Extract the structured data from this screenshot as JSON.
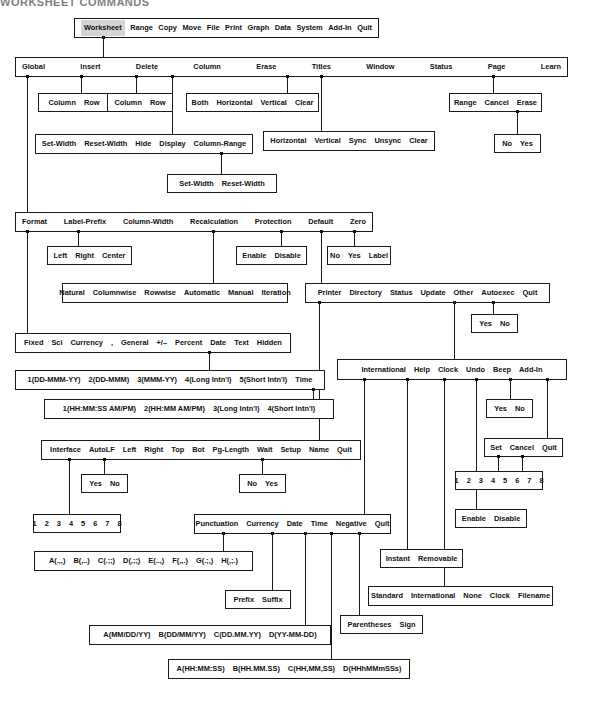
{
  "document": {
    "header_text": "WORKSHEET COMMANDS",
    "diagram_type": "menu-tree",
    "title": "Lotus 1-2-3 Worksheet command menu map"
  },
  "colors": {
    "line": "#1a1a1a",
    "text": "#111111",
    "highlight": "#d4d4d4",
    "background": "#ffffff"
  },
  "boxes": {
    "main_menu": {
      "name": "main-menu",
      "items": [
        "Worksheet",
        "Range",
        "Copy",
        "Move",
        "File",
        "Print",
        "Graph",
        "Data",
        "System",
        "Add-In",
        "Quit"
      ],
      "selected": "Worksheet"
    },
    "worksheet_menu": {
      "name": "worksheet-menu",
      "items": [
        "Global",
        "Insert",
        "Delete",
        "Column",
        "Erase",
        "Titles",
        "Window",
        "Status",
        "Page",
        "Learn"
      ]
    },
    "insert_menu": {
      "name": "insert-menu",
      "items": [
        "Column",
        "Row"
      ]
    },
    "delete_menu": {
      "name": "delete-menu",
      "items": [
        "Column",
        "Row"
      ]
    },
    "titles_menu": {
      "name": "titles-menu",
      "items": [
        "Both",
        "Horizontal",
        "Vertical",
        "Clear"
      ]
    },
    "learn_menu": {
      "name": "learn-menu",
      "items": [
        "Range",
        "Cancel",
        "Erase"
      ]
    },
    "learn_erase_menu": {
      "name": "learn-erase-menu",
      "items": [
        "No",
        "Yes"
      ]
    },
    "column_menu": {
      "name": "column-menu",
      "items": [
        "Set-Width",
        "Reset-Width",
        "Hide",
        "Display",
        "Column-Range"
      ]
    },
    "window_menu": {
      "name": "window-menu",
      "items": [
        "Horizontal",
        "Vertical",
        "Sync",
        "Unsync",
        "Clear"
      ]
    },
    "column_range_menu": {
      "name": "column-range-menu",
      "items": [
        "Set-Width",
        "Reset-Width"
      ]
    },
    "global_menu": {
      "name": "global-menu",
      "items": [
        "Format",
        "Label-Prefix",
        "Column-Width",
        "Recalculation",
        "Protection",
        "Default",
        "Zero"
      ]
    },
    "label_prefix_menu": {
      "name": "label-prefix-menu",
      "items": [
        "Left",
        "Right",
        "Center"
      ]
    },
    "protection_menu": {
      "name": "protection-menu",
      "items": [
        "Enable",
        "Disable"
      ]
    },
    "zero_menu": {
      "name": "zero-menu",
      "items": [
        "No",
        "Yes",
        "Label"
      ]
    },
    "recalculation_menu": {
      "name": "recalculation-menu",
      "items": [
        "Natural",
        "Columnwise",
        "Rowwise",
        "Automatic",
        "Manual",
        "Iteration"
      ]
    },
    "default_menu": {
      "name": "default-menu",
      "items": [
        "Printer",
        "Directory",
        "Status",
        "Update",
        "Other",
        "Autoexec",
        "Quit"
      ]
    },
    "autoexec_menu": {
      "name": "autoexec-menu",
      "items": [
        "Yes",
        "No"
      ]
    },
    "format_menu": {
      "name": "format-menu",
      "items": [
        "Fixed",
        "Sci",
        "Currency",
        ",",
        "General",
        "+/–",
        "Percent",
        "Date",
        "Text",
        "Hidden"
      ]
    },
    "other_menu": {
      "name": "other-menu",
      "items": [
        "International",
        "Help",
        "Clock",
        "Undo",
        "Beep",
        "Add-In"
      ]
    },
    "date_menu": {
      "name": "date-format-menu",
      "items": [
        "1(DD-MMM-YY)",
        "2(DD-MMM)",
        "3(MMM-YY)",
        "4(Long Intn'l)",
        "5(Short Intn'l)",
        "Time"
      ]
    },
    "help_menu": {
      "name": "help-menu",
      "items": [
        "Yes",
        "No"
      ]
    },
    "beep_menu": {
      "name": "beep-menu",
      "items": [
        "Yes",
        "No"
      ]
    },
    "time_menu": {
      "name": "time-format-menu",
      "items": [
        "1(HH:MM:SS AM/PM)",
        "2(HH:MM AM/PM)",
        "3(Long Intn'l)",
        "4(Short Intn'l)"
      ]
    },
    "addin_menu": {
      "name": "add-in-menu",
      "items": [
        "Set",
        "Cancel",
        "Quit"
      ]
    },
    "printer_menu": {
      "name": "printer-menu",
      "items": [
        "Interface",
        "AutoLF",
        "Left",
        "Right",
        "Top",
        "Bot",
        "Pg-Length",
        "Wait",
        "Setup",
        "Name",
        "Quit"
      ]
    },
    "autolf_menu": {
      "name": "autolf-menu",
      "items": [
        "Yes",
        "No"
      ]
    },
    "wait_menu": {
      "name": "wait-menu",
      "items": [
        "No",
        "Yes"
      ]
    },
    "addin_numbers_menu": {
      "name": "add-in-slot-menu",
      "items": [
        "1",
        "2",
        "3",
        "4",
        "5",
        "6",
        "7",
        "8"
      ]
    },
    "undo_menu": {
      "name": "undo-menu",
      "items": [
        "Enable",
        "Disable"
      ]
    },
    "interface_menu": {
      "name": "interface-menu",
      "items": [
        "1",
        "2",
        "3",
        "4",
        "5",
        "6",
        "7",
        "8"
      ]
    },
    "international_menu": {
      "name": "international-menu",
      "items": [
        "Punctuation",
        "Currency",
        "Date",
        "Time",
        "Negative",
        "Quit"
      ]
    },
    "help_type_menu": {
      "name": "help-type-menu",
      "items": [
        "Instant",
        "Removable"
      ]
    },
    "punctuation_menu": {
      "name": "punctuation-menu",
      "items": [
        "A(.,,)",
        "B(,..)",
        "C(.;;)",
        "D(,;;)",
        "E(..,)",
        "F(,,.)",
        "G(.;,)",
        "H(,;.)"
      ]
    },
    "currency_menu": {
      "name": "currency-menu",
      "items": [
        "Prefix",
        "Suffix"
      ]
    },
    "clock_menu": {
      "name": "clock-menu",
      "items": [
        "Standard",
        "International",
        "None",
        "Clock",
        "Filename"
      ]
    },
    "negative_menu": {
      "name": "negative-menu",
      "items": [
        "Parentheses",
        "Sign"
      ]
    },
    "intl_date_menu": {
      "name": "international-date-menu",
      "items": [
        "A(MM/DD/YY)",
        "B(DD/MM/YY)",
        "C(DD.MM.YY)",
        "D(YY-MM-DD)"
      ]
    },
    "intl_time_menu": {
      "name": "international-time-menu",
      "items": [
        "A(HH:MM:SS)",
        "B(HH.MM.SS)",
        "C(HH,MM,SS)",
        "D(HHhMMmSSs)"
      ]
    }
  }
}
